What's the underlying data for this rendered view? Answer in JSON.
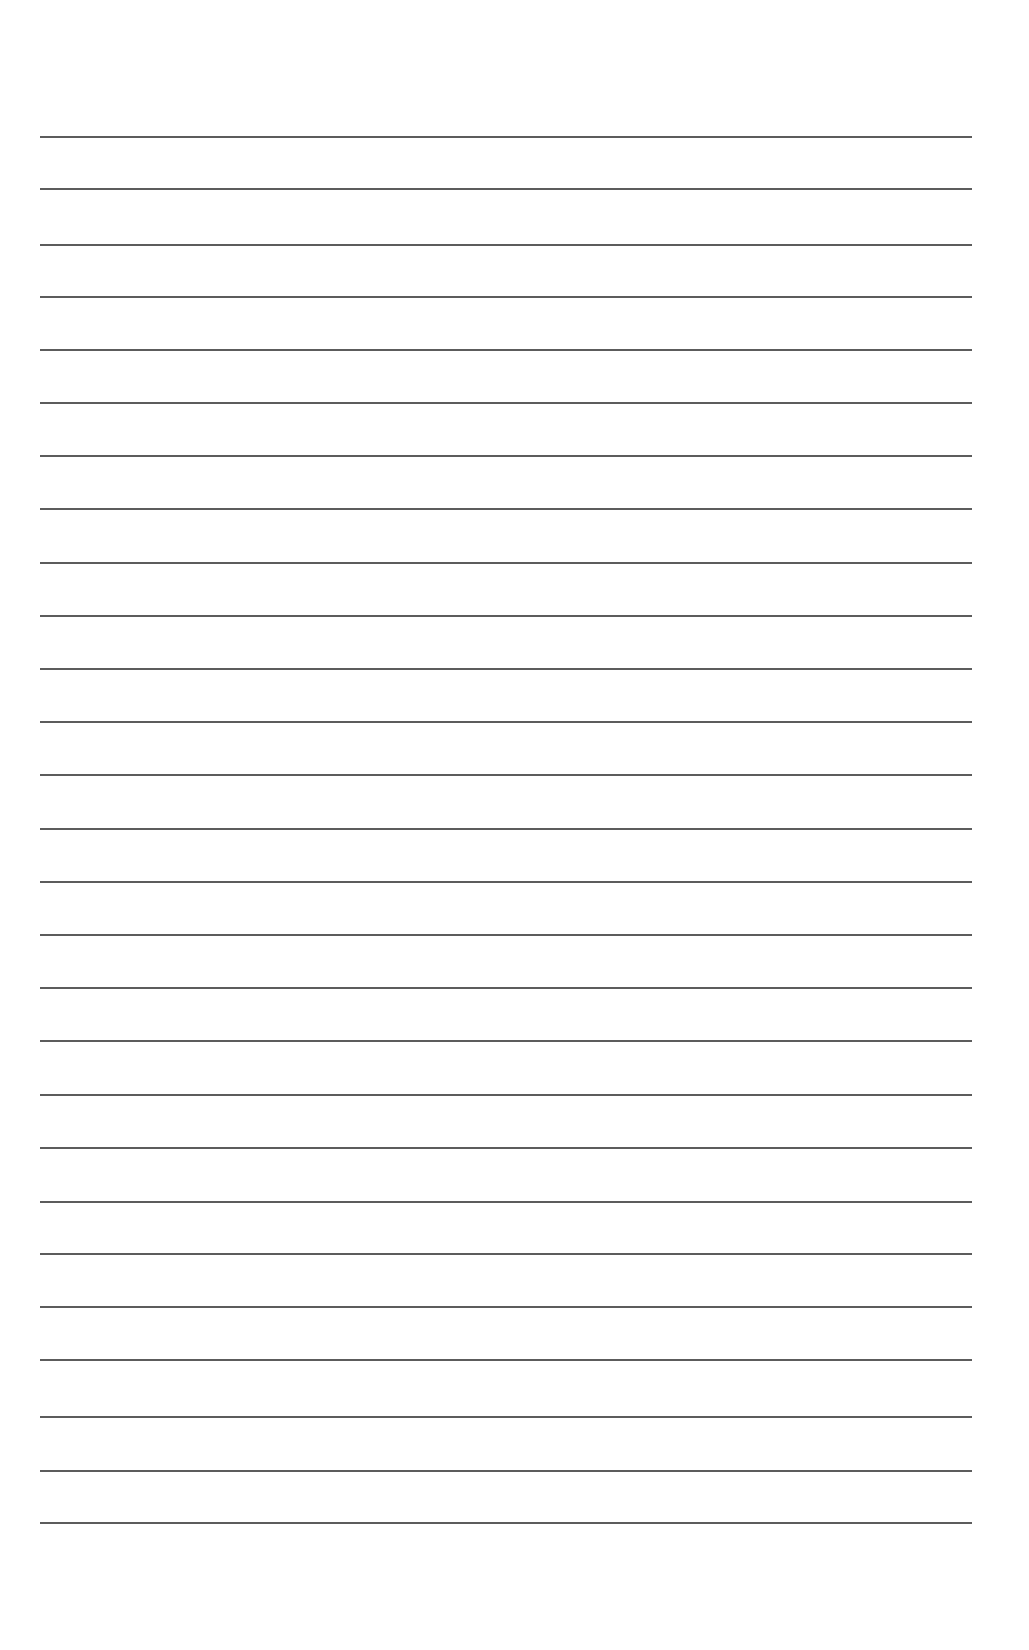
{
  "page": {
    "type": "blank lined writing paper",
    "background_color": "#ffffff",
    "rule_color": "#4a4a4a",
    "rule_count": 27,
    "rule_left": 40,
    "rule_right": 972,
    "rule_positions_y": [
      137,
      189,
      245,
      297,
      350,
      403,
      456,
      509,
      563,
      616,
      669,
      722,
      775,
      829,
      882,
      935,
      988,
      1041,
      1095,
      1148,
      1202,
      1254,
      1307,
      1360,
      1417,
      1471,
      1523
    ]
  }
}
